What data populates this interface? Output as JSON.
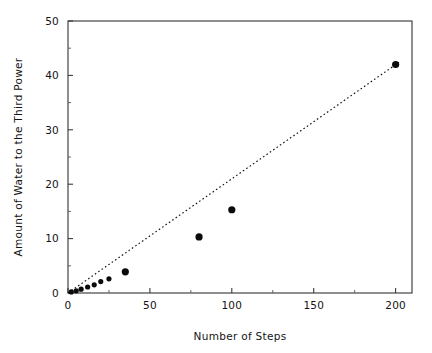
{
  "chart_data": {
    "type": "scatter",
    "title": "",
    "xlabel": "Number of Steps",
    "ylabel": "Amount of Water to the Third Power",
    "xlim": [
      0,
      210
    ],
    "ylim": [
      0,
      50
    ],
    "xticks": [
      0,
      50,
      100,
      150,
      200
    ],
    "yticks": [
      0,
      10,
      20,
      30,
      40,
      50
    ],
    "xtick_labels": [
      "0",
      "50",
      "100",
      "150",
      "200"
    ],
    "ytick_labels": [
      "0",
      "10",
      "20",
      "30",
      "40",
      "50"
    ],
    "grid": false,
    "legend": false,
    "marker_color": "#0b0b0b",
    "line_color": "#111111",
    "background_color": "#ffffff",
    "series": [
      {
        "name": "Measured water amount",
        "style": "scatter",
        "points": [
          {
            "x": 2,
            "y": 0.2
          },
          {
            "x": 5,
            "y": 0.4
          },
          {
            "x": 8,
            "y": 0.7
          },
          {
            "x": 12,
            "y": 1.1
          },
          {
            "x": 16,
            "y": 1.5
          },
          {
            "x": 20,
            "y": 2.1
          },
          {
            "x": 25,
            "y": 2.6
          },
          {
            "x": 35,
            "y": 3.9
          },
          {
            "x": 80,
            "y": 10.3
          },
          {
            "x": 100,
            "y": 15.3
          },
          {
            "x": 200,
            "y": 42.0
          }
        ]
      },
      {
        "name": "Reference trend line",
        "style": "dotted-line",
        "points": [
          {
            "x": 0,
            "y": 0
          },
          {
            "x": 202,
            "y": 42.4
          }
        ]
      }
    ]
  },
  "axes": {
    "x_axis_label": "Number of Steps",
    "y_axis_label": "Amount of Water to the Third Power"
  }
}
